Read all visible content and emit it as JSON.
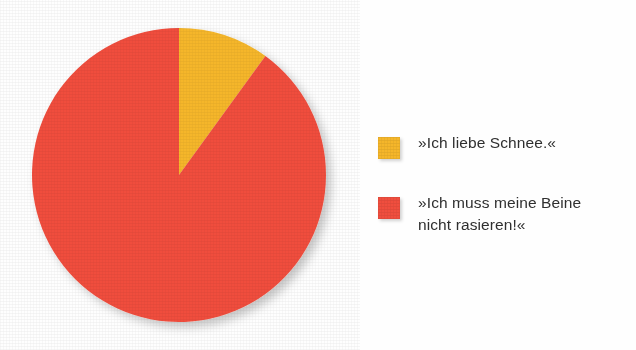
{
  "chart_data": {
    "type": "pie",
    "title": "",
    "subtitle": "",
    "xlabel": "",
    "ylabel": "",
    "grid": false,
    "legend_position": "right",
    "start_angle_deg": 0,
    "direction": "clockwise",
    "categories": [
      "»Ich liebe Schnee.«",
      "»Ich muss meine Beine nicht rasieren!«"
    ],
    "values": [
      10,
      90
    ],
    "slices": [
      {
        "label": "»Ich liebe Schnee.«",
        "value": 10,
        "percent": 10,
        "start_angle_deg": 0,
        "end_angle_deg": 36,
        "color": "#f5b62a"
      },
      {
        "label": "»Ich muss meine Beine nicht rasieren!«",
        "value": 90,
        "percent": 90,
        "start_angle_deg": 36,
        "end_angle_deg": 360,
        "color": "#f04e3e"
      }
    ]
  },
  "pie": {
    "center_x": 179,
    "center_y": 175,
    "radius": 147
  },
  "legend": {
    "items": [
      {
        "label": "»Ich liebe Schnee.«",
        "color": "#f5b62a",
        "swatch_name": "legend-swatch-yellow"
      },
      {
        "label": "»Ich muss meine Beine\nnicht rasieren!«",
        "color": "#f04e3e",
        "swatch_name": "legend-swatch-red"
      }
    ]
  },
  "colors": {
    "background": "#fefefe",
    "yellow": "#f5b62a",
    "red": "#f04e3e",
    "text": "#2f2f2f"
  }
}
